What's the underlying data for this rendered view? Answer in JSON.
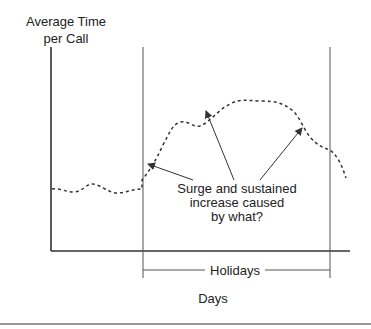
{
  "diagram": {
    "y_axis_label_line1": "Average Time",
    "y_axis_label_line2": "per Call",
    "x_axis_label": "Days",
    "period_label": "Holidays",
    "annotation_line1": "Surge and sustained",
    "annotation_line2": "increase caused",
    "annotation_line3": "by what?",
    "colors": {
      "axis": "#333333",
      "curve": "#333333",
      "background": "#ffffff"
    }
  }
}
